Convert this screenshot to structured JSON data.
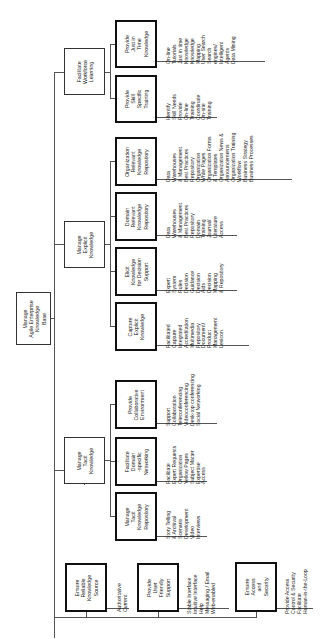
{
  "diagram": {
    "orientation": "rotated 90deg counter-clockwise (text reads bottom-to-top)",
    "root": {
      "id": "root",
      "label": "Manage\nAgile Enterprise\nKnowledge\nBase",
      "x": 16,
      "y": 292,
      "w": 35,
      "h": 53
    },
    "level1": [
      {
        "id": "facilitate-workforce-learning",
        "label": "Facilitate\nWorkforce\nLearning",
        "x": 64,
        "y": 48,
        "w": 41,
        "h": 47
      },
      {
        "id": "manage-explicit-knowledge",
        "label": "Manage\nExplicit\nKnowledge",
        "x": 64,
        "y": 221,
        "w": 41,
        "h": 47
      },
      {
        "id": "manage-tacit-knowledge",
        "label": "Manage\nTacit\nKnowledge",
        "x": 64,
        "y": 437,
        "w": 41,
        "h": 47
      },
      {
        "id": "ensure-reliable-knowledge-source",
        "label": "Ensure\nReliable\nKnowledge\nSource",
        "x": 65,
        "y": 563,
        "w": 42,
        "h": 49,
        "leaves": {
          "x": 117,
          "y": 612,
          "text": "Authoritative\nCurrent"
        }
      },
      {
        "id": "provide-user-friendly-support",
        "label": "Provide\nUser\nFriendly\nSupport",
        "x": 137,
        "y": 563,
        "w": 42,
        "h": 49,
        "leaves": {
          "x": 187,
          "y": 614,
          "text": "Stable Interface\nIntuitive Interface\nHelp\nMessaging / Email\nWeb-enabled"
        }
      },
      {
        "id": "ensure-access-and-security",
        "label": "Ensure\nAccess\nand\nSecurity",
        "x": 235,
        "y": 562,
        "w": 42,
        "h": 50,
        "leaves": {
          "x": 285,
          "y": 614,
          "text": "Provide Access\nControl & Security\nFacilitate\nHuman-in-the-Loop"
        }
      }
    ],
    "level2": [
      {
        "id": "provide-just-in-time-knowledge",
        "parent": "facilitate-workforce-learning",
        "label": "Provide\nJust in\nTime\nKnowledge",
        "x": 115,
        "y": 20,
        "w": 42,
        "h": 48,
        "leaves": {
          "x": 166,
          "y": 64,
          "text": "On-line\nTutorials\nJust in time\nKnowledge\nKnowledge\nMapping\nUser Search\nSearch\nengines/\nIntelligent\nAgents\nData Mining"
        }
      },
      {
        "id": "provide-skill-specific-training",
        "parent": "facilitate-workforce-learning",
        "label": "Provide\nSkill\nSpecific\nTraining",
        "x": 115,
        "y": 75,
        "w": 42,
        "h": 48,
        "leaves": {
          "x": 166,
          "y": 120,
          "text": "Identify\nSkill Needs\nProvide\nOn-line\nTraining\nCoordinate\nOn-site\nTraining"
        }
      },
      {
        "id": "organization-relevant-knowledge-repository",
        "parent": "manage-explicit-knowledge",
        "label": "Organization\nRelevant\nKnowledge\nRepository",
        "x": 115,
        "y": 137,
        "w": 42,
        "h": 49,
        "leaves": {
          "x": 166,
          "y": 182,
          "text": "Data\nWarehouses\n& Management\nBest Practices\nRepository\nOrganization\nWhite Pages\nOrganization Forms\n& Templates\nOrganization News &\nAnnouncements\nOrganization Training\nWorkflow\nBusiness Strategy\nBusiness Processes"
        }
      },
      {
        "id": "domain-relevant-knowledge-repository",
        "parent": "manage-explicit-knowledge",
        "label": "Domain\nRelevant\nKnowledge\nRepository",
        "x": 115,
        "y": 192,
        "w": 42,
        "h": 49,
        "leaves": {
          "x": 166,
          "y": 238,
          "text": "Data\nWarehouses\n& Management\nBest Practices\nRepository\nDomain\nTraining\nJournal/\nLiterature\nAccess"
        }
      },
      {
        "id": "elicit-knowledge-for-decision-support",
        "parent": "manage-explicit-knowledge",
        "label": "Elicit\nKnowledge\nfor Decision\nSupport",
        "x": 115,
        "y": 247,
        "w": 42,
        "h": 49,
        "leaves": {
          "x": 166,
          "y": 293,
          "text": "Expert\nSystem\nRules\nDecision\nGuidance\nDecision\nAids\nDecision\nMapping\n& Repository"
        }
      },
      {
        "id": "capture-explicit-knowledge",
        "parent": "manage-explicit-knowledge",
        "label": "Capture\nExplicit\nKnowledge",
        "x": 115,
        "y": 302,
        "w": 42,
        "h": 49,
        "leaves": {
          "x": 166,
          "y": 348,
          "text": "Facilitated\nCapture\nIntegrated\nAccreditation\nMultimedia\nRepository\nDocument/\nProduct\nManagement\nLexicon"
        }
      },
      {
        "id": "provide-collaborative-environment",
        "parent": "manage-tacit-knowledge",
        "label": "Provide\nCollaborative\nEnvironment",
        "x": 115,
        "y": 380,
        "w": 42,
        "h": 49,
        "leaves": {
          "x": 166,
          "y": 426,
          "text": "Support\nCollaboration\nTeleconferencing\nVideoconferencing\nDesk-top conferencing\nSocial Networking"
        }
      },
      {
        "id": "facilitate-domain-specific-networking",
        "parent": "manage-tacit-knowledge",
        "label": "Facilitate\nDomain\n-specific\nNetworking",
        "x": 115,
        "y": 437,
        "w": 42,
        "h": 49,
        "leaves": {
          "x": 166,
          "y": 484,
          "text": "Facilitate\nExpert Requests\nOrganization\nYellow Pages\nSubject Matter\nExpertise\nAccess"
        }
      },
      {
        "id": "manage-tacit-knowledge-repository",
        "parent": "manage-tacit-knowledge",
        "label": "Manage\nTacit\nKnowledge\nRepository",
        "x": 115,
        "y": 492,
        "w": 42,
        "h": 49,
        "leaves": {
          "x": 166,
          "y": 539,
          "text": "Story Telling\n& Archival\nScenario\nDevelopment\nVideo\nInterviews"
        }
      }
    ]
  }
}
